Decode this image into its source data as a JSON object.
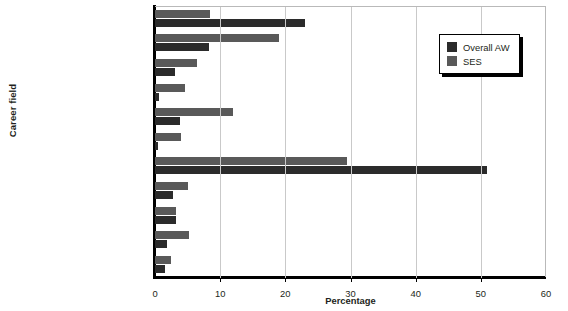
{
  "chart_data": {
    "type": "bar",
    "orientation": "horizontal",
    "title": "",
    "xlabel": "Percentage",
    "ylabel": "Career field",
    "xlim": [
      0,
      60
    ],
    "xticks": [
      0,
      10,
      20,
      30,
      40,
      50,
      60
    ],
    "grid": false,
    "legend_position": "top-right",
    "categories": [
      "Program management",
      "Contracting",
      "Production quality",
      "Business",
      "Life-cycle logistics",
      "Information technology",
      "Systems engineering",
      "Test evaluation",
      "Auditing",
      "Facility engineering",
      "Missing or other"
    ],
    "series": [
      {
        "name": "Overall AW",
        "color": "#2b2b2b",
        "values": [
          23,
          8.3,
          3,
          0.6,
          3.8,
          0.5,
          51,
          2.8,
          3.2,
          1.8,
          1.5
        ]
      },
      {
        "name": "SES",
        "color": "#595959",
        "values": [
          8.4,
          19,
          6.5,
          4.6,
          12,
          4,
          29.5,
          5,
          3.2,
          5.2,
          2.5
        ]
      }
    ]
  },
  "legend": {
    "items": [
      {
        "label": "Overall AW"
      },
      {
        "label": "SES"
      }
    ]
  },
  "axes": {
    "x_title": "Percentage",
    "y_title": "Career field",
    "x_tick_labels": [
      "0",
      "10",
      "20",
      "30",
      "40",
      "50",
      "60"
    ]
  }
}
